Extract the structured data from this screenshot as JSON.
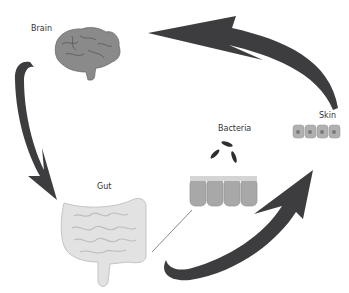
{
  "diagram": {
    "nodes": [
      {
        "id": "brain",
        "label": "Brain"
      },
      {
        "id": "gut",
        "label": "Gut"
      },
      {
        "id": "bacteria",
        "label": "Bacteria"
      },
      {
        "id": "skin",
        "label": "Skin"
      }
    ],
    "edges": [
      {
        "from": "brain",
        "to": "gut"
      },
      {
        "from": "gut",
        "to": "skin"
      },
      {
        "from": "skin",
        "to": "brain"
      }
    ],
    "colors": {
      "arrow": "#3d3d3f",
      "organ": "#d9d9d9",
      "brain": "#8a8a8a",
      "cell": "#a8a8a8",
      "bacteria": "#2e2e2e",
      "text": "#333333"
    }
  }
}
